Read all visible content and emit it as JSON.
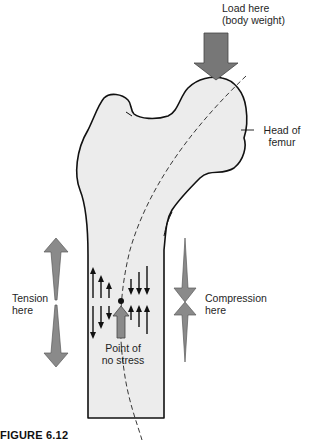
{
  "labels": {
    "load": [
      "Load here",
      "(body weight)"
    ],
    "head": [
      "Head of",
      "femur"
    ],
    "tension": [
      "Tension",
      "here"
    ],
    "compression": [
      "Compression",
      "here"
    ],
    "no_stress": [
      "Point of",
      "no stress"
    ]
  },
  "caption": "FIGURE 6.12",
  "colors": {
    "bone_fill": "#ececec",
    "outline": "#111111",
    "arrow_fill": "#8a8a8a",
    "arrow_stroke": "#5a5a5a"
  }
}
